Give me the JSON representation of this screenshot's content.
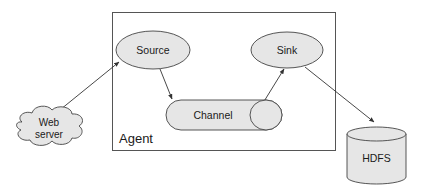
{
  "diagram": {
    "title": "",
    "container": {
      "label": "Agent"
    },
    "nodes": [
      {
        "id": "web-server",
        "label_line1": "Web",
        "label_line2": "server",
        "shape": "cloud"
      },
      {
        "id": "source",
        "label": "Source",
        "shape": "ellipse"
      },
      {
        "id": "channel",
        "label": "Channel",
        "shape": "horizontal-cylinder"
      },
      {
        "id": "sink",
        "label": "Sink",
        "shape": "ellipse"
      },
      {
        "id": "hdfs",
        "label": "HDFS",
        "shape": "cylinder"
      }
    ],
    "edges": [
      {
        "from": "web-server",
        "to": "source"
      },
      {
        "from": "source",
        "to": "channel"
      },
      {
        "from": "channel",
        "to": "sink"
      },
      {
        "from": "sink",
        "to": "hdfs"
      }
    ],
    "colors": {
      "fill": "#e6e6e6",
      "stroke": "#444444",
      "text": "#1a1a1a"
    }
  }
}
